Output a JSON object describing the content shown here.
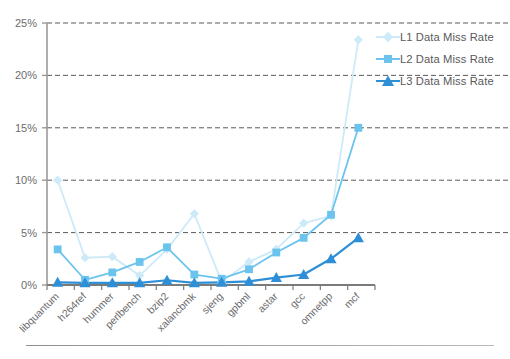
{
  "chart_data": {
    "type": "line",
    "title": "",
    "xlabel": "",
    "ylabel": "",
    "ylim": [
      0,
      25
    ],
    "yticks": [
      0,
      5,
      10,
      15,
      20,
      25
    ],
    "ytick_labels": [
      "0%",
      "5%",
      "10%",
      "15%",
      "20%",
      "25%"
    ],
    "grid": true,
    "legend_position": "right",
    "categories": [
      "libquantum",
      "h264ref",
      "hummer",
      "perlbench",
      "bzip2",
      "xalancbmk",
      "sjeng",
      "gpbml",
      "astar",
      "gcc",
      "omnetpp",
      "mcf"
    ],
    "series": [
      {
        "name": "L1 Data Miss Rate",
        "color": "#cdeaf8",
        "marker": "diamond",
        "values": [
          10.0,
          2.6,
          2.7,
          0.9,
          3.4,
          6.8,
          0.3,
          2.2,
          3.4,
          5.9,
          6.6,
          23.4
        ]
      },
      {
        "name": "L2 Data Miss Rate",
        "color": "#6cc4ee",
        "marker": "square",
        "values": [
          3.4,
          0.5,
          1.2,
          2.2,
          3.6,
          1.0,
          0.6,
          1.5,
          3.1,
          4.5,
          6.7,
          15.0
        ]
      },
      {
        "name": "L3 Data Miss Rate",
        "color": "#2e8fd6",
        "marker": "triangle",
        "values": [
          0.25,
          0.2,
          0.2,
          0.2,
          0.45,
          0.2,
          0.25,
          0.35,
          0.7,
          1.0,
          2.5,
          4.5
        ]
      }
    ]
  },
  "legend": {
    "items": [
      {
        "label": "L1 Data Miss Rate"
      },
      {
        "label": "L2 Data Miss Rate"
      },
      {
        "label": "L3 Data Miss Rate"
      }
    ]
  },
  "axes": {
    "axis_color": "#9a9a9a",
    "grid_color": "#5a5a5a"
  }
}
